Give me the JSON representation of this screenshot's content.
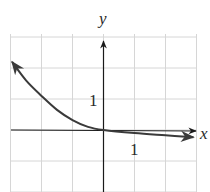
{
  "chart_data": {
    "type": "line",
    "title": "",
    "xlabel": "x",
    "ylabel": "y",
    "xlim": [
      -3,
      3
    ],
    "ylim": [
      -2,
      3
    ],
    "grid": true,
    "tick_labels": {
      "x": "1",
      "y": "1"
    },
    "series": [
      {
        "name": "curve",
        "x": [
          -2.95,
          -2.5,
          -2,
          -1.5,
          -1,
          -0.5,
          0,
          1,
          2,
          2.9
        ],
        "y": [
          2.2,
          1.6,
          1.1,
          0.65,
          0.32,
          0.1,
          0,
          -0.1,
          -0.17,
          -0.23
        ],
        "arrows": "both ends"
      }
    ],
    "colors": {
      "curve": "#3a3a3a",
      "axes": "#1a1a1a",
      "grid": "#d6d6d6"
    }
  },
  "labels": {
    "x_axis": "x",
    "y_axis": "y",
    "x_tick": "1",
    "y_tick": "1"
  }
}
